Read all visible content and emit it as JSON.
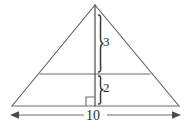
{
  "figure": {
    "kind": "geometry-diagram",
    "stroke_color": "#555555",
    "label_color": "#2b2b2b",
    "background_color": "#ffffff",
    "labels": {
      "upper_segment": "3",
      "lower_segment": "2",
      "base": "10"
    },
    "geometry": {
      "apex": [
        95,
        5
      ],
      "base_left": [
        12,
        106
      ],
      "base_right": [
        179,
        106
      ],
      "midsegment_left": [
        40,
        74
      ],
      "midsegment_right": [
        150,
        74
      ],
      "altitude_x": 95,
      "altitude_top_y": 5,
      "altitude_bottom_y": 106,
      "right_angle_size": 9,
      "dimension_line_y": 115,
      "dimension_left_x": 10,
      "dimension_right_x": 181
    }
  }
}
